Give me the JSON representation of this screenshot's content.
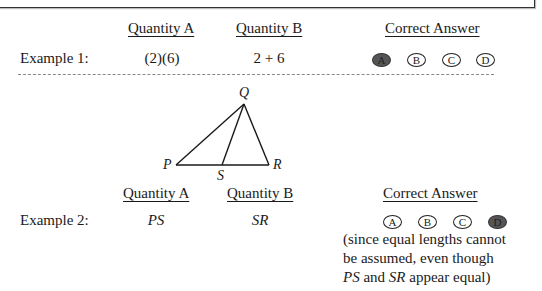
{
  "examples": [
    {
      "label": "Example 1:",
      "quantity_a_header": "Quantity A",
      "quantity_b_header": "Quantity B",
      "answer_header": "Correct Answer",
      "quantity_a": "(2)(6)",
      "quantity_b": "2 + 6",
      "choices": [
        "A",
        "B",
        "C",
        "D"
      ],
      "selected": "A"
    },
    {
      "label": "Example 2:",
      "quantity_a_header": "Quantity A",
      "quantity_b_header": "Quantity B",
      "answer_header": "Correct Answer",
      "quantity_a": "PS",
      "quantity_b": "SR",
      "choices": [
        "A",
        "B",
        "C",
        "D"
      ],
      "selected": "D",
      "note_line1": "(since equal lengths cannot",
      "note_line2": "be assumed, even though",
      "note_line3_a": "PS",
      "note_line3_b": " and ",
      "note_line3_c": "SR",
      "note_line3_d": " appear equal)"
    }
  ],
  "figure": {
    "vertices": {
      "P": "P",
      "Q": "Q",
      "R": "R",
      "S": "S"
    }
  },
  "colors": {
    "selected_fill": "#555555",
    "line": "#1a1a1a"
  }
}
